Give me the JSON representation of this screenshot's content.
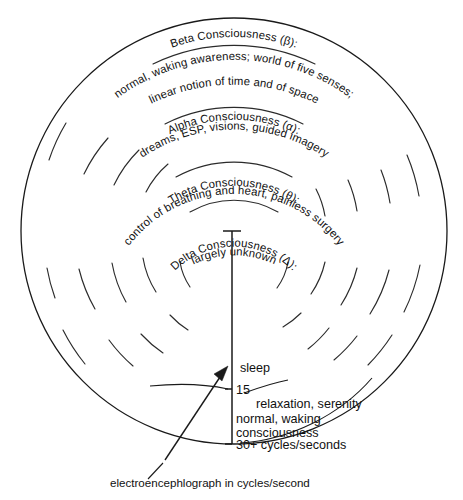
{
  "figure": {
    "caption": "electroencephlograph in cycles/second"
  },
  "bands": [
    {
      "id": "beta",
      "name": "Beta Consciousness (β):",
      "line2": "normal, waking awareness; world of five senses;",
      "line3": "linear notion of time and of space"
    },
    {
      "id": "alpha",
      "name": "Alpha Consciousness (α):",
      "line2": "dreams, ESP, visions, guided imagery",
      "line3": ""
    },
    {
      "id": "theta",
      "name": "Theta Consciousness (θ):",
      "line2": "control of breathing and heart, painless surgery",
      "line3": ""
    },
    {
      "id": "delta",
      "name": "Delta Consciousness (Δ):",
      "line2": "largely unknown",
      "line3": ""
    }
  ],
  "axis": {
    "label_sleep": "sleep",
    "tick_15": "15",
    "tick_30": "30+ cycles/seconds"
  },
  "annotations": {
    "relaxation": "relaxation, serenity",
    "normal_waking_1": "normal, waking",
    "normal_waking_2": "consciousness"
  },
  "colors": {
    "ink": "#1a1a1a",
    "background": "#ffffff"
  }
}
